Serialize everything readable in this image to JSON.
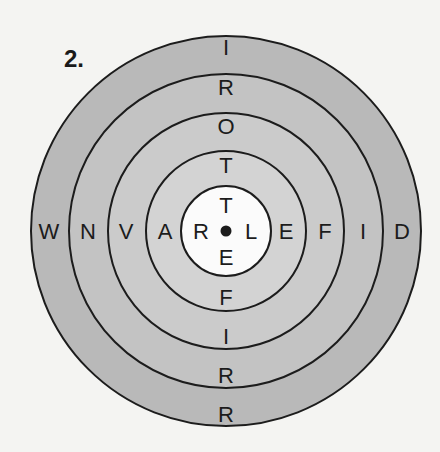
{
  "puzzle": {
    "number_label": "2.",
    "center": {
      "x": 226,
      "y": 231
    },
    "rings": [
      {
        "radius": 195,
        "fill": "#b9b9b9"
      },
      {
        "radius": 157,
        "fill": "#c3c3c3"
      },
      {
        "radius": 118,
        "fill": "#cbcbcb"
      },
      {
        "radius": 80,
        "fill": "#d3d3d3"
      },
      {
        "radius": 45,
        "fill": "#fbfbfb"
      }
    ],
    "stroke_color": "#1c1c1c",
    "vertical_letters": [
      {
        "ch": "I",
        "y": 47
      },
      {
        "ch": "R",
        "y": 87
      },
      {
        "ch": "O",
        "y": 126
      },
      {
        "ch": "T",
        "y": 165
      },
      {
        "ch": "T",
        "y": 205
      },
      {
        "ch": "E",
        "y": 257
      },
      {
        "ch": "F",
        "y": 297
      },
      {
        "ch": "I",
        "y": 336
      },
      {
        "ch": "R",
        "y": 375
      },
      {
        "ch": "R",
        "y": 414
      }
    ],
    "horizontal_letters": [
      {
        "ch": "W",
        "x": 49
      },
      {
        "ch": "N",
        "x": 88
      },
      {
        "ch": "V",
        "x": 126
      },
      {
        "ch": "A",
        "x": 165
      },
      {
        "ch": "R",
        "x": 201
      },
      {
        "ch": "L",
        "x": 251
      },
      {
        "ch": "E",
        "x": 286
      },
      {
        "ch": "F",
        "x": 325
      },
      {
        "ch": "I",
        "x": 363
      },
      {
        "ch": "D",
        "x": 402
      }
    ],
    "center_dot": "bullseye-dot"
  }
}
